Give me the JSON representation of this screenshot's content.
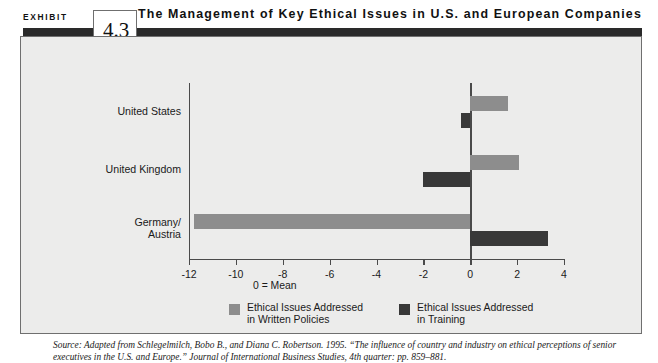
{
  "header": {
    "exhibit_word": "EXHIBIT",
    "exhibit_number": "4.3",
    "title": "The Management of Key Ethical Issues in U.S. and European Companies"
  },
  "mean_note": "0 = Mean",
  "source": "Source: Adapted from Schlegelmilch, Bobo B., and Diana C. Robertson. 1995. “The influence of country and industry on ethical perceptions of senior executives in the U.S. and Europe.” Journal of International Business Studies, 4th quarter: pp. 859–881.",
  "colors": {
    "light_bar": "#8d8d8d",
    "dark_bar": "#383838",
    "panel_background": "#ececeb",
    "rule": "#2a2a2a"
  },
  "legend": [
    {
      "label": "Ethical Issues Addressed\nin Written Policies",
      "swatch": "light"
    },
    {
      "label": "Ethical Issues Addressed\nin Training",
      "swatch": "dark"
    }
  ],
  "chart_data": {
    "type": "bar",
    "orientation": "horizontal",
    "title": "The Management of Key Ethical Issues in U.S. and European Companies",
    "xlabel": "",
    "ylabel": "",
    "categories": [
      "United States",
      "United Kingdom",
      "Germany/\nAustria"
    ],
    "series": [
      {
        "name": "Ethical Issues Addressed in Written Policies",
        "color": "#8d8d8d",
        "values": [
          1.6,
          2.1,
          -11.8
        ]
      },
      {
        "name": "Ethical Issues Addressed in Training",
        "color": "#383838",
        "values": [
          -0.4,
          -2.0,
          3.3
        ]
      }
    ],
    "xlim": [
      -12,
      4
    ],
    "xticks": [
      -12,
      -10,
      -8,
      -6,
      -4,
      -2,
      0,
      2,
      4
    ],
    "xticklabels": [
      "-12",
      "-10",
      "-8",
      "-6",
      "-4",
      "-2",
      "0",
      "2",
      "4"
    ],
    "grid": false,
    "legend_position": "bottom",
    "annotations": [
      "0 = Mean"
    ],
    "zero_reference": 0
  }
}
